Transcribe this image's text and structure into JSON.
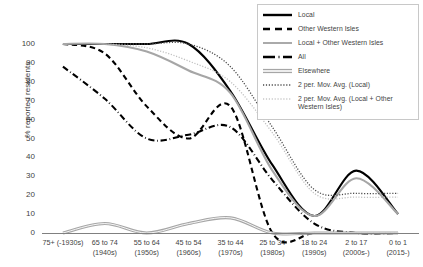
{
  "chart_data": {
    "type": "line",
    "title": "",
    "xlabel": "",
    "ylabel": "% reported residents",
    "ylim": [
      0,
      100
    ],
    "ytick_step": 10,
    "yticks": [
      100,
      90,
      80,
      70,
      60,
      50,
      40,
      30,
      20,
      10,
      0
    ],
    "grid": false,
    "legend_position": "top-right",
    "categories": [
      "75+ (-1930s)",
      "65 to 74 (1940s)",
      "55 to 64 (1950s)",
      "45 to 54 (1960s)",
      "35 to 44 (1970s)",
      "25 to 34 (1980s)",
      "18 to 24 (1990s)",
      "2 to 17 (2000s-)",
      "0 to 1 (2015-)"
    ],
    "category_lines": [
      [
        "75+ (-1930s)",
        ""
      ],
      [
        "65 to 74",
        "(1940s)"
      ],
      [
        "55 to 64",
        "(1950s)"
      ],
      [
        "45 to 54",
        "(1960s)"
      ],
      [
        "35 to 44",
        "(1970s)"
      ],
      [
        "25 to 34",
        "(1980s)"
      ],
      [
        "18 to 24",
        "(1990s)"
      ],
      [
        "2 to 17",
        "(2000s-)"
      ],
      [
        "0 to 1",
        "(2015-)"
      ]
    ],
    "series": [
      {
        "name": "Local",
        "style": "solid",
        "color": "#000000",
        "width": 2.1,
        "values": [
          100,
          100,
          100,
          100,
          75,
          36,
          9,
          33,
          10
        ]
      },
      {
        "name": "Other Western Isles",
        "style": "dashed",
        "color": "#000000",
        "width": 2.1,
        "values": [
          100,
          95,
          67,
          50,
          67,
          0,
          0,
          0,
          0
        ]
      },
      {
        "name": "Local + Other Western Isles",
        "style": "solid",
        "color": "#a6a6a6",
        "width": 2.1,
        "values": [
          100,
          100,
          96,
          86,
          74,
          33,
          9,
          29,
          10
        ]
      },
      {
        "name": "All",
        "style": "dashdot",
        "color": "#000000",
        "width": 2.1,
        "values": [
          88,
          71,
          50,
          52,
          56,
          28,
          5,
          0,
          0
        ]
      },
      {
        "name": "Elsewhere",
        "style": "double",
        "color": "#a6a6a6",
        "width": 1.2,
        "values": [
          0,
          5,
          0,
          5,
          8,
          0,
          0,
          0,
          0
        ]
      },
      {
        "name": "2 per. Mov. Avg. (Local)",
        "style": "dotted",
        "color": "#4a4a4a",
        "width": 1.3,
        "values": [
          null,
          100,
          100,
          100,
          88,
          56,
          23,
          21,
          21
        ]
      },
      {
        "name": "2 per. Mov. Avg. (Local + Other Western Isles)",
        "style": "dotted",
        "color": "#c0c0c0",
        "width": 1.3,
        "values": [
          null,
          100,
          98,
          91,
          80,
          53,
          21,
          19,
          19
        ]
      }
    ]
  },
  "legend": {
    "items": [
      {
        "label": "Local",
        "key": "solid-black-line-key"
      },
      {
        "label": "Other Western Isles",
        "key": "dashed-black-line-key"
      },
      {
        "label": "Local + Other Western Isles",
        "key": "solid-gray-line-key"
      },
      {
        "label": "All",
        "key": "dashdot-black-line-key"
      },
      {
        "label": "Elsewhere",
        "key": "double-gray-line-key"
      },
      {
        "label": "2 per. Mov. Avg. (Local)",
        "key": "dotted-dark-line-key"
      },
      {
        "label": "2 per. Mov. Avg. (Local + Other Western Isles)",
        "key": "dotted-light-line-key"
      }
    ]
  },
  "colors": {
    "black": "#000000",
    "gray": "#a6a6a6",
    "light_gray": "#c0c0c0",
    "text": "#3f3f3f",
    "legend_border": "#c8c8c8"
  }
}
